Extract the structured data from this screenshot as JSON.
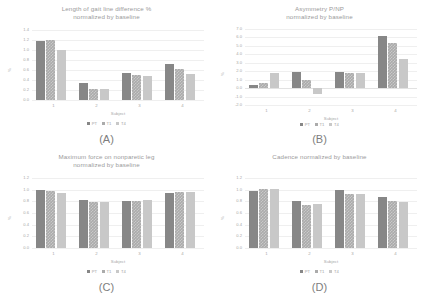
{
  "figure": {
    "series_names": [
      "PT",
      "T1",
      "T4"
    ],
    "series_colors": [
      "#878787",
      "#ababab",
      "#c8c8c8"
    ],
    "panels": [
      "(A)",
      "(B)",
      "(C)",
      "(D)"
    ]
  },
  "chart_data": [
    {
      "id": "A",
      "type": "bar",
      "title_line1": "Length of gait line difference %",
      "title_line2": "normalized by baseline",
      "panel_label": "(A)",
      "xlabel": "Subject",
      "ylabel": "%",
      "categories": [
        "1",
        "2",
        "3",
        "4"
      ],
      "yticks": [
        "1.4",
        "1.2",
        "1.0",
        "0.8",
        "0.6",
        "0.4",
        "0.2",
        "0.0"
      ],
      "ylim": [
        0.0,
        1.4
      ],
      "grid": true,
      "legend": "bottom",
      "series": [
        {
          "name": "PT",
          "values": [
            1.19,
            0.35,
            0.55,
            0.72
          ]
        },
        {
          "name": "T1",
          "values": [
            1.2,
            0.22,
            0.51,
            0.63
          ]
        },
        {
          "name": "T4",
          "values": [
            1.0,
            0.22,
            0.48,
            0.52
          ]
        }
      ]
    },
    {
      "id": "B",
      "type": "bar",
      "title_line1": "Asymmetry P/NP",
      "title_line2": "normalized by baseline",
      "panel_label": "(B)",
      "xlabel": "Subject",
      "ylabel": "%",
      "categories": [
        "1",
        "2",
        "3",
        "4"
      ],
      "yticks": [
        "7.0",
        "6.0",
        "5.0",
        "4.0",
        "3.0",
        "2.0",
        "1.0",
        "0.0",
        "-1.0",
        "-2.0"
      ],
      "ylim": [
        -2.0,
        7.0
      ],
      "grid": true,
      "legend": "bottom",
      "series": [
        {
          "name": "PT",
          "values": [
            0.4,
            1.9,
            1.9,
            6.2
          ]
        },
        {
          "name": "T1",
          "values": [
            0.6,
            1.0,
            1.8,
            5.4
          ]
        },
        {
          "name": "T4",
          "values": [
            1.8,
            -0.7,
            1.8,
            3.4
          ]
        }
      ]
    },
    {
      "id": "C",
      "type": "bar",
      "title_line1": "Maximum force on nonparetic leg",
      "title_line2": "normalized by baseline",
      "panel_label": "(C)",
      "xlabel": "Subject",
      "ylabel": "%",
      "categories": [
        "1",
        "2",
        "3",
        "4"
      ],
      "yticks": [
        "1.2",
        "1.0",
        "0.8",
        "0.6",
        "0.4",
        "0.2",
        "0.0"
      ],
      "ylim": [
        0.0,
        1.2
      ],
      "grid": true,
      "legend": "bottom",
      "series": [
        {
          "name": "PT",
          "values": [
            1.0,
            0.82,
            0.8,
            0.94
          ]
        },
        {
          "name": "T1",
          "values": [
            0.98,
            0.79,
            0.81,
            0.96
          ]
        },
        {
          "name": "T4",
          "values": [
            0.95,
            0.79,
            0.82,
            0.96
          ]
        }
      ]
    },
    {
      "id": "D",
      "type": "bar",
      "title_line1": "Cadence normalized by baseline",
      "title_line2": "",
      "panel_label": "(D)",
      "xlabel": "Subject",
      "ylabel": "%",
      "categories": [
        "1",
        "2",
        "3",
        "4"
      ],
      "yticks": [
        "1.2",
        "1.0",
        "0.8",
        "0.6",
        "0.4",
        "0.2",
        "0.0"
      ],
      "ylim": [
        0.0,
        1.2
      ],
      "grid": true,
      "legend": "bottom",
      "series": [
        {
          "name": "PT",
          "values": [
            0.97,
            0.81,
            1.0,
            0.87
          ]
        },
        {
          "name": "T1",
          "values": [
            1.02,
            0.74,
            0.93,
            0.8
          ]
        },
        {
          "name": "T4",
          "values": [
            1.02,
            0.75,
            0.93,
            0.79
          ]
        }
      ]
    }
  ]
}
